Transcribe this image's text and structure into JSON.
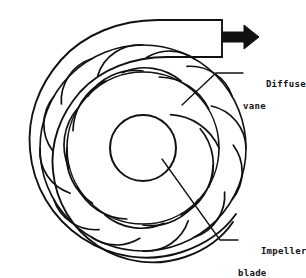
{
  "figure": {
    "type": "cross-section-diagram",
    "background_color": "#ffffff",
    "line_color": "#111111"
  },
  "labels": {
    "diffuser": {
      "line1": "Diffuser",
      "line2": "vane",
      "full": "Diffuser vane"
    },
    "impeller": {
      "line1": "Impeller",
      "line2": "blade",
      "full": "Impeller blade"
    }
  },
  "flow": {
    "arrow_direction": "right",
    "arrow_color": "#111111",
    "description": "discharge flow arrow"
  },
  "geometry": {
    "center_x": 143,
    "center_y": 148,
    "hub_radius": 33,
    "impeller_blade_count": 12,
    "impeller_inner_radius": 33,
    "impeller_outer_radius": 76,
    "diffuser_vane_count": 12,
    "diffuser_inner_radius": 78,
    "diffuser_outer_radius": 103,
    "volute_start_radius": 104,
    "volute_end_radius": 134,
    "duct_top_y": 20,
    "duct_bottom_y": 57,
    "duct_right_x": 222
  }
}
